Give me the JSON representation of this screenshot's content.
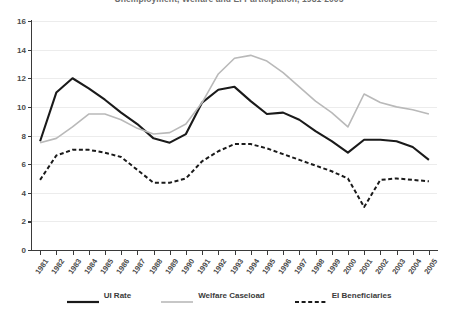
{
  "chart_data": {
    "type": "line",
    "title": "Unemployment, Welfare and EI Participation, 1981-2005",
    "xlabel": "",
    "ylabel": "",
    "ylim": [
      0,
      16
    ],
    "yticks": [
      0,
      2,
      4,
      6,
      8,
      10,
      12,
      14,
      16
    ],
    "grid": true,
    "legend_position": "bottom",
    "categories": [
      "1981",
      "1982",
      "1983",
      "1984",
      "1985",
      "1986",
      "1987",
      "1988",
      "1989",
      "1990",
      "1991",
      "1992",
      "1993",
      "1994",
      "1995",
      "1996",
      "1997",
      "1998",
      "1999",
      "2000",
      "2001",
      "2002",
      "2003",
      "2004",
      "2005"
    ],
    "series": [
      {
        "name": "UI Rate",
        "style": "solid",
        "color": "#1a1a1a",
        "values": [
          7.6,
          11.0,
          12.0,
          11.3,
          10.5,
          9.6,
          8.8,
          7.8,
          7.5,
          8.1,
          10.3,
          11.2,
          11.4,
          10.4,
          9.5,
          9.6,
          9.1,
          8.3,
          7.6,
          6.8,
          7.7,
          7.7,
          7.6,
          7.2,
          6.3
        ]
      },
      {
        "name": "Welfare Caseload",
        "style": "solid",
        "color": "#b9b9b9",
        "values": [
          7.5,
          7.8,
          8.6,
          9.5,
          9.5,
          9.1,
          8.5,
          8.1,
          8.2,
          8.8,
          10.3,
          12.3,
          13.4,
          13.6,
          13.2,
          12.4,
          11.4,
          10.4,
          9.6,
          8.6,
          10.9,
          10.3,
          10.0,
          9.8,
          9.5
        ]
      },
      {
        "name": "EI Beneficiaries",
        "style": "dashed",
        "color": "#1a1a1a",
        "values": [
          4.9,
          6.6,
          7.0,
          7.0,
          6.8,
          6.5,
          5.6,
          4.7,
          4.7,
          5.0,
          6.2,
          6.9,
          7.4,
          7.4,
          7.1,
          6.7,
          6.3,
          5.9,
          5.5,
          5.0,
          3.0,
          4.9,
          5.0,
          4.9,
          4.8
        ]
      }
    ]
  },
  "legend": {
    "items": [
      {
        "label": "UI Rate"
      },
      {
        "label": "Welfare Caseload"
      },
      {
        "label": "EI Beneficiaries"
      }
    ]
  }
}
